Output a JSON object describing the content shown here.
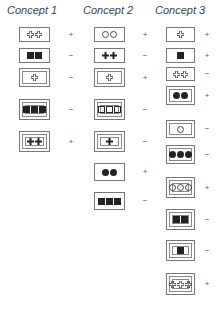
{
  "columns": [
    {
      "title": "Concept 1",
      "items": [
        {
          "border": 1,
          "shape": "cross",
          "fill": "outline",
          "count": 2,
          "label": "+"
        },
        {
          "border": 1,
          "shape": "square",
          "fill": "solid",
          "count": 2,
          "label": "−"
        },
        {
          "border": 2,
          "shape": "cross",
          "fill": "outline",
          "count": 1,
          "label": "−"
        },
        {
          "border": 3,
          "shape": "square",
          "fill": "solid",
          "count": 3,
          "label": "−"
        },
        {
          "border": 3,
          "shape": "cross",
          "fill": "solid",
          "count": 2,
          "label": "+"
        }
      ]
    },
    {
      "title": "Concept 2",
      "items": [
        {
          "border": 1,
          "shape": "circle",
          "fill": "outline",
          "count": 2,
          "label": "+"
        },
        {
          "border": 1,
          "shape": "cross",
          "fill": "solid",
          "count": 2,
          "label": "−"
        },
        {
          "border": 2,
          "shape": "cross",
          "fill": "outline",
          "count": 1,
          "label": "+"
        },
        {
          "border": 3,
          "shape": "square",
          "fill": "outline",
          "count": 3,
          "label": "−"
        },
        {
          "border": 3,
          "shape": "cross",
          "fill": "solid",
          "count": 1,
          "label": "−"
        },
        {
          "border": 1,
          "shape": "circle",
          "fill": "solid",
          "count": 2,
          "label": "+"
        },
        {
          "border": 1,
          "shape": "square",
          "fill": "solid",
          "count": 3,
          "label": "−"
        }
      ]
    },
    {
      "title": "Concept 3",
      "items": [
        {
          "border": 1,
          "shape": "cross",
          "fill": "outline",
          "count": 1,
          "label": "+"
        },
        {
          "border": 1,
          "shape": "square",
          "fill": "solid",
          "count": 1,
          "label": "+"
        },
        {
          "border": 1,
          "shape": "cross",
          "fill": "outline",
          "count": 2,
          "label": "−"
        },
        {
          "border": 2,
          "shape": "circle",
          "fill": "solid",
          "count": 2,
          "label": "+"
        },
        {
          "border": 2,
          "shape": "circle",
          "fill": "outline",
          "count": 1,
          "label": "−"
        },
        {
          "border": 2,
          "shape": "circle",
          "fill": "solid",
          "count": 3,
          "label": "−"
        },
        {
          "border": 3,
          "shape": "circle",
          "fill": "outline",
          "count": 3,
          "label": "+"
        },
        {
          "border": 3,
          "shape": "square",
          "fill": "solid",
          "count": 2,
          "label": "−"
        },
        {
          "border": 3,
          "shape": "square",
          "fill": "solid",
          "count": 1,
          "label": "−"
        },
        {
          "border": 3,
          "shape": "cross",
          "fill": "outline",
          "count": 3,
          "label": "+"
        }
      ]
    }
  ],
  "colors": {
    "ink": "#222222",
    "border": "#777777",
    "background": "#ffffff"
  }
}
